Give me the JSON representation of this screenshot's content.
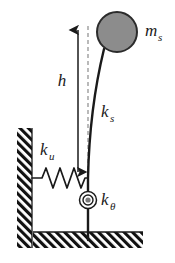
{
  "figure": {
    "type": "mechanical-schematic",
    "background_color": "#ffffff"
  },
  "labels": {
    "mass": {
      "symbol": "m",
      "subscript": "s",
      "x": 145,
      "y": 36
    },
    "height": {
      "symbol": "h",
      "subscript": "",
      "x": 62,
      "y": 86
    },
    "column_stiffness": {
      "symbol": "k",
      "subscript": "s",
      "x": 102,
      "y": 117
    },
    "lateral_spring_stiffness": {
      "symbol": "k",
      "subscript": "u",
      "x": 40,
      "y": 155
    },
    "rotational_spring_stiffness": {
      "symbol": "k",
      "subscript": "θ",
      "x": 101,
      "y": 205
    }
  },
  "elements": {
    "mass_circle": {
      "name": "mass-circle",
      "center_x": 117,
      "center_y": 32,
      "radius": 20,
      "fill": "#8c8c8c",
      "stroke": "#2b2b2b",
      "stroke_width": 2
    },
    "column": {
      "name": "flexible-column",
      "path": "M 104 49 C 96 82, 89 130, 88 178 L 88 240",
      "stroke": "#1a1a1a",
      "stroke_width": 2.4
    },
    "dashed_reference_line": {
      "name": "vertical-reference-line",
      "x": 88,
      "y_top": 26,
      "y_bottom": 178,
      "stroke": "#8c8c8c",
      "dash": "4,3"
    },
    "height_arrow": {
      "name": "height-dimension-arrow",
      "x": 78,
      "y_top": 24,
      "y_bottom": 178,
      "stroke": "#1a1a1a",
      "stroke_width": 1.4
    },
    "lateral_spring": {
      "name": "lateral-spring",
      "y": 178,
      "x_start": 31,
      "x_end": 88,
      "coils": 4,
      "amplitude": 11,
      "stroke": "#1a1a1a"
    },
    "rotational_spring_pivot": {
      "name": "rotational-spring-pivot",
      "center_x": 88,
      "center_y": 200,
      "outer_radius": 8.5,
      "inner_radius": 5,
      "dot_radius": 2.6,
      "dot_fill": "#7a7a7a",
      "stroke": "#1a1a1a"
    },
    "wall": {
      "name": "hatched-wall",
      "x": 17,
      "y": 128,
      "width": 15,
      "height": 120
    },
    "ground": {
      "name": "hatched-ground",
      "x": 33,
      "y": 232,
      "width": 110,
      "height": 16
    }
  },
  "colors": {
    "ink": "#1a1a1a",
    "mass_fill": "#8c8c8c",
    "dashed_gray": "#8c8c8c",
    "hatch": "#111111"
  }
}
